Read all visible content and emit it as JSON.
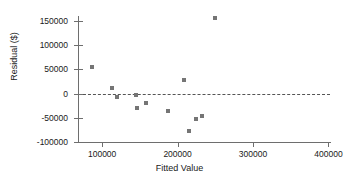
{
  "chart_data": {
    "type": "scatter",
    "title": "",
    "xlabel": "Fitted Value",
    "ylabel": "Residual ($)",
    "xlim": [
      68000,
      402000
    ],
    "ylim": [
      -100000,
      160000
    ],
    "grid": false,
    "legend": null,
    "xticks": [
      100000,
      200000,
      300000,
      400000
    ],
    "xtick_labels": [
      "100000",
      "200000",
      "300000",
      "400000"
    ],
    "yticks": [
      150000,
      100000,
      50000,
      0,
      -50000,
      -100000
    ],
    "ytick_labels": [
      "150000",
      "100000",
      "50000",
      "0",
      "-50000",
      "-100000"
    ],
    "reference_line": {
      "axis": "y",
      "value": 0,
      "style": "dashed",
      "color": "#555555"
    },
    "marker": {
      "shape": "square",
      "color": "#757575",
      "size": 4
    },
    "points": [
      {
        "x": 86000,
        "y": 54000
      },
      {
        "x": 113000,
        "y": 12000
      },
      {
        "x": 120000,
        "y": -8000
      },
      {
        "x": 145000,
        "y": -4000
      },
      {
        "x": 146000,
        "y": -29000
      },
      {
        "x": 158000,
        "y": -19000
      },
      {
        "x": 187000,
        "y": -35000
      },
      {
        "x": 209000,
        "y": 27000
      },
      {
        "x": 215000,
        "y": -77000
      },
      {
        "x": 225000,
        "y": -53000
      },
      {
        "x": 232000,
        "y": -47000
      },
      {
        "x": 250000,
        "y": 156000
      }
    ],
    "series": [
      {
        "name": "Residuals",
        "x": [
          86000,
          113000,
          120000,
          145000,
          146000,
          158000,
          187000,
          209000,
          215000,
          225000,
          232000,
          250000
        ],
        "values": [
          54000,
          12000,
          -8000,
          -4000,
          -29000,
          -19000,
          -35000,
          27000,
          -77000,
          -53000,
          -47000,
          156000
        ]
      }
    ]
  },
  "axis_colors": {
    "axis": "#6e6e6e",
    "text": "#1a1a1a",
    "background": "#ffffff"
  }
}
